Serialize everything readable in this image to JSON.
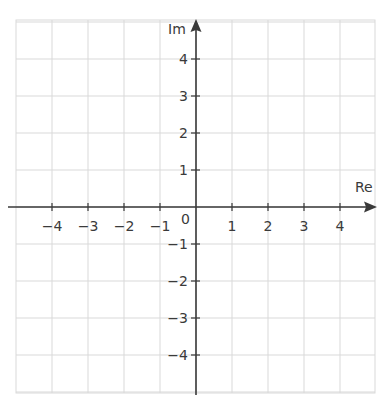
{
  "diagram": {
    "type": "argand-diagram",
    "axes": {
      "x_label": "Re",
      "y_label": "Im",
      "origin_label": "0"
    },
    "x_ticks": [
      {
        "value": -4,
        "label": "−4"
      },
      {
        "value": -3,
        "label": "−3"
      },
      {
        "value": -2,
        "label": "−2"
      },
      {
        "value": -1,
        "label": "−1"
      },
      {
        "value": 1,
        "label": "1"
      },
      {
        "value": 2,
        "label": "2"
      },
      {
        "value": 3,
        "label": "3"
      },
      {
        "value": 4,
        "label": "4"
      }
    ],
    "y_ticks": [
      {
        "value": 4,
        "label": "4"
      },
      {
        "value": 3,
        "label": "3"
      },
      {
        "value": 2,
        "label": "2"
      },
      {
        "value": 1,
        "label": "1"
      },
      {
        "value": -1,
        "label": "−1"
      },
      {
        "value": -2,
        "label": "−2"
      },
      {
        "value": -3,
        "label": "−3"
      },
      {
        "value": -4,
        "label": "−4"
      }
    ],
    "colors": {
      "grid": "#d9d9d9",
      "axis": "#3a3a3a",
      "text": "#3a3a3a"
    }
  }
}
